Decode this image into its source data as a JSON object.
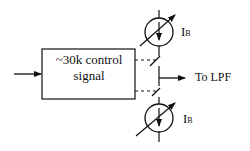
{
  "diagram": {
    "block": {
      "line1": "~30k control",
      "line2": "signal"
    },
    "output_label": "To LPF",
    "current_source_top": {
      "label_main": "I",
      "label_sub": "B"
    },
    "current_source_bottom": {
      "label_main": "I",
      "label_sub": "B"
    },
    "colors": {
      "stroke": "#111111",
      "background": "#ffffff"
    }
  }
}
